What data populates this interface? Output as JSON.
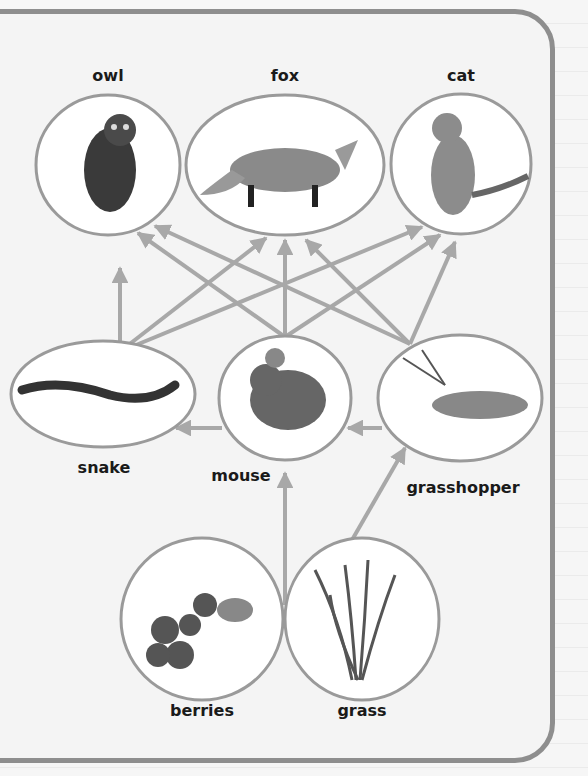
{
  "diagram": {
    "type": "food-web",
    "colors": {
      "border": "#8e8e8e",
      "arrow": "#a8a8a8",
      "node_stroke": "#9a9a9a",
      "node_fill": "#ffffff",
      "text": "#1a1a1a"
    },
    "nodes": {
      "owl": {
        "label": "owl"
      },
      "fox": {
        "label": "fox"
      },
      "cat": {
        "label": "cat"
      },
      "snake": {
        "label": "snake"
      },
      "mouse": {
        "label": "mouse"
      },
      "grasshopper": {
        "label": "grasshopper"
      },
      "berries": {
        "label": "berries"
      },
      "grass": {
        "label": "grass"
      }
    },
    "edges": [
      [
        "berries",
        "mouse"
      ],
      [
        "grass",
        "mouse"
      ],
      [
        "grass",
        "grasshopper"
      ],
      [
        "grasshopper",
        "mouse"
      ],
      [
        "mouse",
        "snake"
      ],
      [
        "snake",
        "owl"
      ],
      [
        "snake",
        "fox"
      ],
      [
        "snake",
        "cat"
      ],
      [
        "mouse",
        "owl"
      ],
      [
        "mouse",
        "fox"
      ],
      [
        "mouse",
        "cat"
      ],
      [
        "grasshopper",
        "owl"
      ],
      [
        "grasshopper",
        "fox"
      ],
      [
        "grasshopper",
        "cat"
      ]
    ]
  }
}
